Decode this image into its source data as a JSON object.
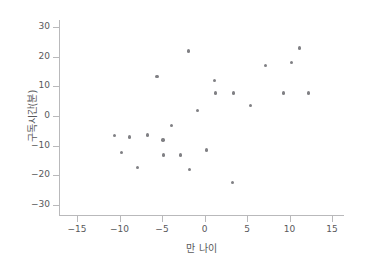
{
  "chart_data": {
    "type": "scatter",
    "title": "",
    "xlabel": "만 나이",
    "ylabel": "구독시간(분)",
    "xlim": [
      -17.8,
      17.2
    ],
    "ylim": [
      -33.7,
      32.3
    ],
    "xticks": [
      -15,
      -10,
      -5,
      0,
      5,
      10,
      15
    ],
    "xtick_labels": [
      "−15",
      "−10",
      "−5",
      "0",
      "5",
      "10",
      "15"
    ],
    "yticks": [
      30,
      20,
      10,
      0,
      -10,
      -20,
      -30
    ],
    "ytick_labels": [
      "30",
      "20",
      "10",
      "0",
      "−10",
      "−20",
      "−30"
    ],
    "grid": false,
    "legend": null,
    "marker_color": "#808084",
    "axis_color": "#b9b9bb",
    "text_color": "#59595b",
    "background": "#ffffff",
    "series": [
      {
        "name": "구독시간 vs 만 나이",
        "points": [
          {
            "x": -10.6,
            "y": -6.5
          },
          {
            "x": -9.8,
            "y": -12.3
          },
          {
            "x": -8.8,
            "y": -7.1
          },
          {
            "x": -7.9,
            "y": -17.4
          },
          {
            "x": -6.7,
            "y": -6.4
          },
          {
            "x": -5.6,
            "y": 13.4
          },
          {
            "x": -4.9,
            "y": -8.1
          },
          {
            "x": -4.8,
            "y": -13.2
          },
          {
            "x": -3.9,
            "y": -3.2
          },
          {
            "x": -2.8,
            "y": -13.2
          },
          {
            "x": -1.9,
            "y": 21.9
          },
          {
            "x": -1.8,
            "y": -18.0
          },
          {
            "x": -0.8,
            "y": 1.8
          },
          {
            "x": 0.2,
            "y": -11.5
          },
          {
            "x": 1.2,
            "y": 12.0
          },
          {
            "x": 1.3,
            "y": 7.8
          },
          {
            "x": 3.3,
            "y": -22.5
          },
          {
            "x": 3.4,
            "y": 7.8
          },
          {
            "x": 5.4,
            "y": 3.6
          },
          {
            "x": 7.2,
            "y": 17.0
          },
          {
            "x": 9.3,
            "y": 7.8
          },
          {
            "x": 10.2,
            "y": 18.0
          },
          {
            "x": 11.2,
            "y": 22.9
          },
          {
            "x": 12.2,
            "y": 7.8
          }
        ]
      }
    ]
  }
}
